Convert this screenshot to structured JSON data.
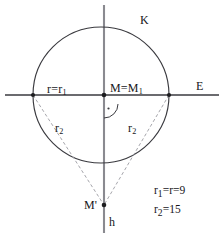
{
  "figure": {
    "background_color": "#ffffff",
    "stroke_color": "#3a3a3f",
    "dashed_color": "#9a9aa0",
    "text_color": "#16161a",
    "labels": {
      "circle": "K",
      "horizontal_line": "E",
      "vertical_line": "h",
      "radius_left": "r=r",
      "radius_left_sub": "1",
      "center": "M=M",
      "center_sub": "1",
      "r2_left": "r",
      "r2_left_sub": "2",
      "r2_right": "r",
      "r2_right_sub": "2",
      "apex_point": "M'"
    },
    "legend": {
      "line1_lead": "r",
      "line1_sub": "1",
      "line1_rest": "=r=9",
      "line2_lead": "r",
      "line2_sub": "2",
      "line2_rest": "=15"
    },
    "geometry": {
      "circle_center_x": 101,
      "circle_center_y": 95,
      "circle_radius": 68,
      "horizontal_line_y": 95,
      "horizontal_line_x1": 5,
      "horizontal_line_x2": 219,
      "vertical_line_x": 104,
      "vertical_line_y1": 5,
      "vertical_line_y2": 233,
      "left_intersection_x": 33,
      "left_intersection_y": 95,
      "right_intersection_x": 169,
      "right_intersection_y": 95,
      "apex_x": 104,
      "apex_y": 205,
      "right_angle_marker": true
    },
    "values": {
      "r1": 9,
      "r": 9,
      "r2": 15
    }
  }
}
